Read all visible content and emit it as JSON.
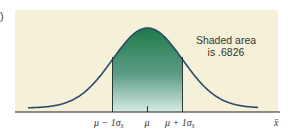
{
  "panel_label": ")",
  "chart_data": {
    "type": "area",
    "title": "",
    "distribution": "normal",
    "xlabel": "x̄",
    "ylabel": "",
    "tick_labels": [
      "μ − 1σx̄",
      "μ",
      "μ + 1σx̄"
    ],
    "shaded_region": {
      "from": "μ − 1σx̄",
      "to": "μ + 1σx̄",
      "area": 0.6826
    },
    "annotation": [
      "Shaded area",
      "is .6826"
    ],
    "grid": false,
    "colors": {
      "background": "#f4f1d8",
      "curve": "#2c4a6e",
      "shade_top": "#1f7a4a",
      "shade_bottom": "#d8ece4"
    }
  },
  "annotation": {
    "line1": "Shaded area",
    "line2": "is .6826"
  },
  "axis": {
    "label_left": "μ − 1σ",
    "label_center": "μ",
    "label_right": "μ + 1σ",
    "sub": "x̄",
    "xlabel": "x̄"
  }
}
